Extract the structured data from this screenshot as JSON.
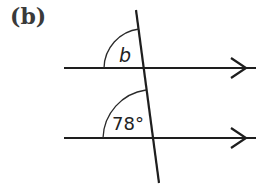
{
  "part_label": "(b)",
  "diagram": {
    "type": "parallel lines cut by a transversal",
    "parallel_lines": [
      {
        "name": "upper",
        "arrow": "single-chevron-right"
      },
      {
        "name": "lower",
        "arrow": "single-chevron-right"
      }
    ],
    "angles": [
      {
        "name": "upper-angle",
        "label": "b",
        "position": "upper-left at upper intersection"
      },
      {
        "name": "lower-angle",
        "label": "78°",
        "position": "upper-left at lower intersection"
      }
    ]
  },
  "colors": {
    "line": "#1e1e1e",
    "label": "#3a3a3a",
    "background": "#ffffff"
  }
}
